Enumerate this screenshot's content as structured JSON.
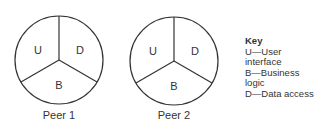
{
  "peers": [
    {
      "caption": "Peer 1",
      "segments": {
        "top_left": "U",
        "top_right": "D",
        "bottom": "B"
      }
    },
    {
      "caption": "Peer 2",
      "segments": {
        "top_left": "U",
        "top_right": "D",
        "bottom": "B"
      }
    }
  ],
  "key": {
    "title": "Key",
    "items": [
      "U—User interface",
      "B—Business logic",
      "D—Data access"
    ]
  }
}
